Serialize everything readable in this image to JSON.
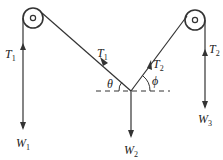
{
  "diagram": {
    "type": "pulley-tension-system",
    "colors": {
      "stroke": "#333333",
      "background": "#ffffff"
    },
    "pulleys": [
      {
        "name": "left-pulley",
        "cx": 33,
        "cy": 18,
        "r": 10
      },
      {
        "name": "right-pulley",
        "cx": 194,
        "cy": 20,
        "r": 10
      }
    ],
    "labels": {
      "t1_left": {
        "base": "T",
        "sub": "1"
      },
      "t1_diag": {
        "base": "T",
        "sub": "1"
      },
      "t2_diag": {
        "base": "T",
        "sub": "2"
      },
      "t2_right": {
        "base": "T",
        "sub": "2"
      },
      "w1": {
        "base": "W",
        "sub": "1"
      },
      "w2": {
        "base": "W",
        "sub": "2"
      },
      "w3": {
        "base": "W",
        "sub": "3"
      },
      "theta": "θ",
      "phi": "ϕ"
    }
  }
}
